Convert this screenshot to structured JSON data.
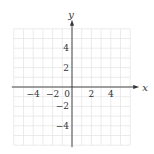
{
  "chart_data": {
    "type": "scatter",
    "title": "",
    "xlabel": "x",
    "ylabel": "y",
    "xlim": [
      -6,
      6
    ],
    "ylim": [
      -6,
      6
    ],
    "grid": true,
    "grid_step": 1,
    "x_tick_labels": [
      "-4",
      "-2",
      "0",
      "2",
      "4"
    ],
    "x_ticks": [
      -4,
      -2,
      0,
      2,
      4
    ],
    "y_tick_labels": [
      "4",
      "2",
      "-2",
      "-4"
    ],
    "y_ticks": [
      4,
      2,
      -2,
      -4
    ],
    "series": [],
    "legend": null
  },
  "colors": {
    "grid": "#e6e6e6",
    "axis": "#333333",
    "background": "#ffffff"
  },
  "layout": {
    "origin_px": [
      72,
      87
    ],
    "unit_px": 9.7
  }
}
